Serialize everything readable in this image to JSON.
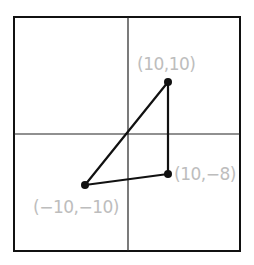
{
  "diagram": {
    "type": "coordinate-plane-triangle",
    "colors": {
      "frame": "#111111",
      "axes": "#222222",
      "triangle": "#111111",
      "points": "#111111",
      "labels": "#bdbdbd",
      "background": "#ffffff"
    },
    "points": [
      {
        "x": 10,
        "y": 10,
        "label": "(10,10)"
      },
      {
        "x": 10,
        "y": -8,
        "label": "(10,−8)"
      },
      {
        "x": -10,
        "y": -10,
        "label": "(−10,−10)"
      }
    ],
    "triangle_vertices": [
      "(10,10)",
      "(10,-8)",
      "(-10,-10)"
    ]
  }
}
